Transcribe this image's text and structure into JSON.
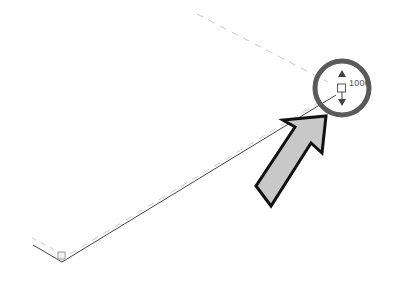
{
  "viewport": {
    "background": "#ffffff"
  },
  "drawing": {
    "edge_color": "#333333",
    "dashed_color": "#cccccc",
    "grip_stroke": "#555555"
  },
  "grip": {
    "label": "1000",
    "icon": "stretch-grip-icon",
    "arrows": [
      "arrow-up-icon",
      "arrow-down-icon"
    ]
  },
  "highlight": {
    "circle_color": "#555555",
    "arrow_fill": "#c8c8c8",
    "arrow_stroke": "#111111"
  }
}
